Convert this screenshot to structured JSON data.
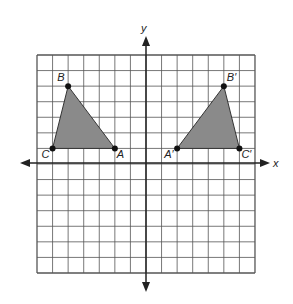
{
  "diagram": {
    "type": "coordinate-plane-reflection",
    "grid": {
      "xmin": -7,
      "xmax": 7,
      "ymin": -7,
      "ymax": 7,
      "step": 1
    },
    "axes": {
      "x_label": "x",
      "y_label": "y"
    },
    "colors": {
      "grid": "#555555",
      "axis": "#222222",
      "fill": "#8a8a8a",
      "point": "#111111"
    },
    "triangles": [
      {
        "name": "ABC",
        "vertices": [
          {
            "label": "A",
            "x": -2,
            "y": 1
          },
          {
            "label": "B",
            "x": -5,
            "y": 5
          },
          {
            "label": "C",
            "x": -6,
            "y": 1
          }
        ]
      },
      {
        "name": "A'B'C'",
        "vertices": [
          {
            "label": "A′",
            "x": 2,
            "y": 1
          },
          {
            "label": "B′",
            "x": 5,
            "y": 5
          },
          {
            "label": "C′",
            "x": 6,
            "y": 1
          }
        ]
      }
    ]
  }
}
